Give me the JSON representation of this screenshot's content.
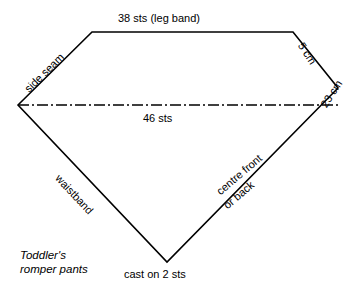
{
  "diagram": {
    "title_caption": {
      "line1": "Toddler's",
      "line2": "romper pants"
    },
    "labels": {
      "top_edge": "38 sts (leg band)",
      "centre_line": "46 sts",
      "bottom_point": "cast on 2 sts",
      "upper_left_edge": "side seam",
      "upper_right_edge": "5 cm",
      "lower_right_measure": "23 cm",
      "lower_left_edge": "waistband",
      "lower_right_edge_line1": "centre front",
      "lower_right_edge_line2": "or back"
    },
    "geometry": {
      "outline_points": "18,105 92,32 293,32 338,88 167,262",
      "centre_line": {
        "x1": 18,
        "y1": 105,
        "x2": 338,
        "y2": 105
      },
      "stroke_color": "#000000",
      "fill_color": "none",
      "background_color": "#ffffff",
      "outline_stroke_width": 1.6,
      "centre_stroke_width": 1.6,
      "centre_dash_pattern": "11,3,2,3"
    }
  }
}
